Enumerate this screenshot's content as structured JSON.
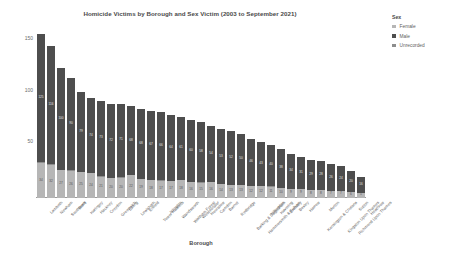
{
  "chart_data": {
    "type": "bar",
    "title": "Homicide Victims by Borough and Sex Victim (2003 to September 2021)",
    "xlabel": "Borough",
    "ylabel": "Count of Method of Killing",
    "ylim": [
      0,
      170
    ],
    "yticks": [
      50,
      100,
      150
    ],
    "grid": false,
    "stacked": true,
    "legend_position": "right",
    "legend_title": "Sex",
    "series": [
      {
        "name": "Female",
        "color": "#b6b6b6",
        "values": [
          34,
          32,
          27,
          26,
          25,
          24,
          21,
          20,
          20,
          22,
          19,
          18,
          17,
          17,
          18,
          16,
          15,
          16,
          14,
          13,
          13,
          12,
          12,
          11,
          10,
          9,
          9,
          8,
          8,
          7,
          7,
          6,
          5
        ]
      },
      {
        "name": "Male",
        "color": "#4e4e4e",
        "values": [
          125,
          116,
          100,
          90,
          79,
          74,
          73,
          72,
          71,
          68,
          68,
          67,
          66,
          64,
          61,
          60,
          58,
          54,
          53,
          52,
          50,
          46,
          43,
          40,
          38,
          34,
          31,
          29,
          28,
          26,
          24,
          20,
          16
        ]
      },
      {
        "name": "Unrecorded",
        "color": "#8d8d8d",
        "values": [
          1,
          1,
          0,
          1,
          0,
          0,
          1,
          0,
          1,
          0,
          0,
          0,
          1,
          0,
          0,
          0,
          1,
          0,
          0,
          0,
          0,
          0,
          0,
          1,
          0,
          0,
          0,
          0,
          0,
          0,
          0,
          0,
          0
        ]
      }
    ],
    "categories": [
      "Lambeth",
      "Newham",
      "Southwark",
      "Brent",
      "Haringey",
      "Hackney",
      "Croydon",
      "Greenwich",
      "Ealing",
      "Lewisham",
      "Enfield",
      "Tower Hamlets",
      "Islington",
      "Wandsworth",
      "Waltham Forest",
      "Westminster",
      "Hounslow",
      "Camden",
      "Barnet",
      "Redbridge",
      "Barking & Dagenham",
      "Hammersmith & Fulham",
      "Hillingdon",
      "Havering",
      "Bromley",
      "Bexley",
      "Harrow",
      "Kensington & Chelsea",
      "Merton",
      "Kingston Upon Thames",
      "Richmond Upon Thames",
      "Sutton",
      "Heathrow"
    ]
  }
}
